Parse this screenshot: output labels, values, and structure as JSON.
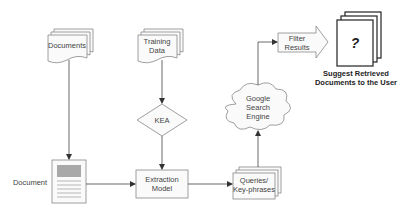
{
  "diagram": {
    "nodes": {
      "documents": {
        "label_lines": [
          "Documents"
        ],
        "shape": "multi-document"
      },
      "training_data": {
        "label_lines": [
          "Training",
          "Data"
        ],
        "shape": "multi-document"
      },
      "kea": {
        "label_lines": [
          "KEA"
        ],
        "shape": "diamond"
      },
      "document": {
        "label_lines": [
          "Document"
        ],
        "shape": "page-icon"
      },
      "extraction_model": {
        "label_lines": [
          "Extraction",
          "Model"
        ],
        "shape": "rectangle"
      },
      "queries": {
        "label_lines": [
          "Queries/",
          "Key-phrases"
        ],
        "shape": "multi-document"
      },
      "google": {
        "label_lines": [
          "Google",
          "Search",
          "Engine"
        ],
        "shape": "cloud"
      },
      "filter_results": {
        "label_lines": [
          "Filter",
          "Results"
        ],
        "shape": "block-arrow"
      },
      "suggest": {
        "label_lines": [
          "Suggest Retrieved",
          "Documents to the User"
        ],
        "glyph": "?",
        "shape": "stacked-pages"
      }
    },
    "edges": [
      {
        "from": "documents",
        "to": "document"
      },
      {
        "from": "training_data",
        "to": "kea"
      },
      {
        "from": "kea",
        "to": "extraction_model"
      },
      {
        "from": "document",
        "to": "extraction_model"
      },
      {
        "from": "extraction_model",
        "to": "queries"
      },
      {
        "from": "queries",
        "to": "google"
      },
      {
        "from": "google",
        "to": "filter_results"
      },
      {
        "from": "filter_results",
        "to": "suggest"
      }
    ],
    "colors": {
      "stroke": "#888888",
      "edge": "#444444",
      "header_block": "#a8a8a8"
    }
  }
}
